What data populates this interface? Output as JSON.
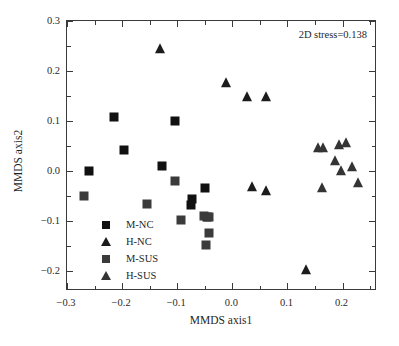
{
  "chart_data": {
    "type": "scatter",
    "title": "",
    "xlabel": "MMDS axis1",
    "ylabel": "MMDS axis2",
    "xlim": [
      -0.3,
      0.2625
    ],
    "ylim": [
      -0.24,
      0.3
    ],
    "xticks": [
      -0.3,
      -0.2,
      -0.1,
      0.0,
      0.1,
      0.2
    ],
    "xticklabels": [
      "-0.3",
      "-0.2",
      "-0.1",
      "0.0",
      "0.1",
      "0.2"
    ],
    "yticks": [
      -0.2,
      -0.1,
      0.0,
      0.1,
      0.2,
      0.3
    ],
    "yticklabels": [
      "-0.2",
      "-0.1",
      "0.0",
      "0.1",
      "0.2",
      "0.3"
    ],
    "minor_tick_interval": 0.05,
    "grid": false,
    "annotation": "2D stress=0.138",
    "legend_position": "lower-left-inside",
    "series": [
      {
        "name": "M-NC",
        "marker": "square",
        "color": "#111111",
        "points": [
          [
            -0.2605,
            0.0005
          ],
          [
            -0.2155,
            0.1075
          ],
          [
            -0.1965,
            0.042
          ],
          [
            -0.127,
            0.011
          ],
          [
            -0.1035,
            0.1
          ],
          [
            -0.0735,
            -0.0555
          ],
          [
            -0.0745,
            -0.0675
          ],
          [
            -0.0495,
            -0.0345
          ],
          [
            -0.0455,
            -0.092
          ]
        ]
      },
      {
        "name": "H-NC",
        "marker": "triangle",
        "color": "#1c1c1c",
        "points": [
          [
            -0.1305,
            0.244
          ],
          [
            -0.012,
            0.176
          ],
          [
            0.0265,
            0.1475
          ],
          [
            0.061,
            0.149
          ],
          [
            0.035,
            -0.0325
          ],
          [
            0.0605,
            -0.039
          ],
          [
            0.1345,
            -0.1975
          ]
        ]
      },
      {
        "name": "M-SUS",
        "marker": "square",
        "color": "#3b3b3b",
        "points": [
          [
            -0.269,
            -0.0495
          ],
          [
            -0.1545,
            -0.066
          ],
          [
            -0.104,
            -0.02
          ],
          [
            -0.093,
            -0.097
          ],
          [
            -0.051,
            -0.0905
          ],
          [
            -0.0415,
            -0.0915
          ],
          [
            -0.0425,
            -0.123
          ],
          [
            -0.047,
            -0.1485
          ]
        ]
      },
      {
        "name": "H-SUS",
        "marker": "triangle",
        "color": "#343434",
        "points": [
          [
            0.1555,
            0.0465
          ],
          [
            0.1645,
            0.047
          ],
          [
            0.1935,
            0.0515
          ],
          [
            0.2055,
            0.056
          ],
          [
            0.186,
            0.0195
          ],
          [
            0.1975,
            0.0005
          ],
          [
            0.2165,
            0.0075
          ],
          [
            0.1625,
            -0.034
          ],
          [
            0.228,
            -0.024
          ]
        ]
      }
    ]
  },
  "axes": {
    "xlabel": "MMDS axis1",
    "ylabel": "MMDS axis2"
  },
  "annotation": {
    "stress": "2D stress=0.138"
  },
  "legend": {
    "items": [
      {
        "label": "M-NC",
        "marker": "square",
        "color": "#111111"
      },
      {
        "label": "H-NC",
        "marker": "triangle",
        "color": "#1c1c1c"
      },
      {
        "label": "M-SUS",
        "marker": "square",
        "color": "#3b3b3b"
      },
      {
        "label": "H-SUS",
        "marker": "triangle",
        "color": "#343434"
      }
    ]
  }
}
